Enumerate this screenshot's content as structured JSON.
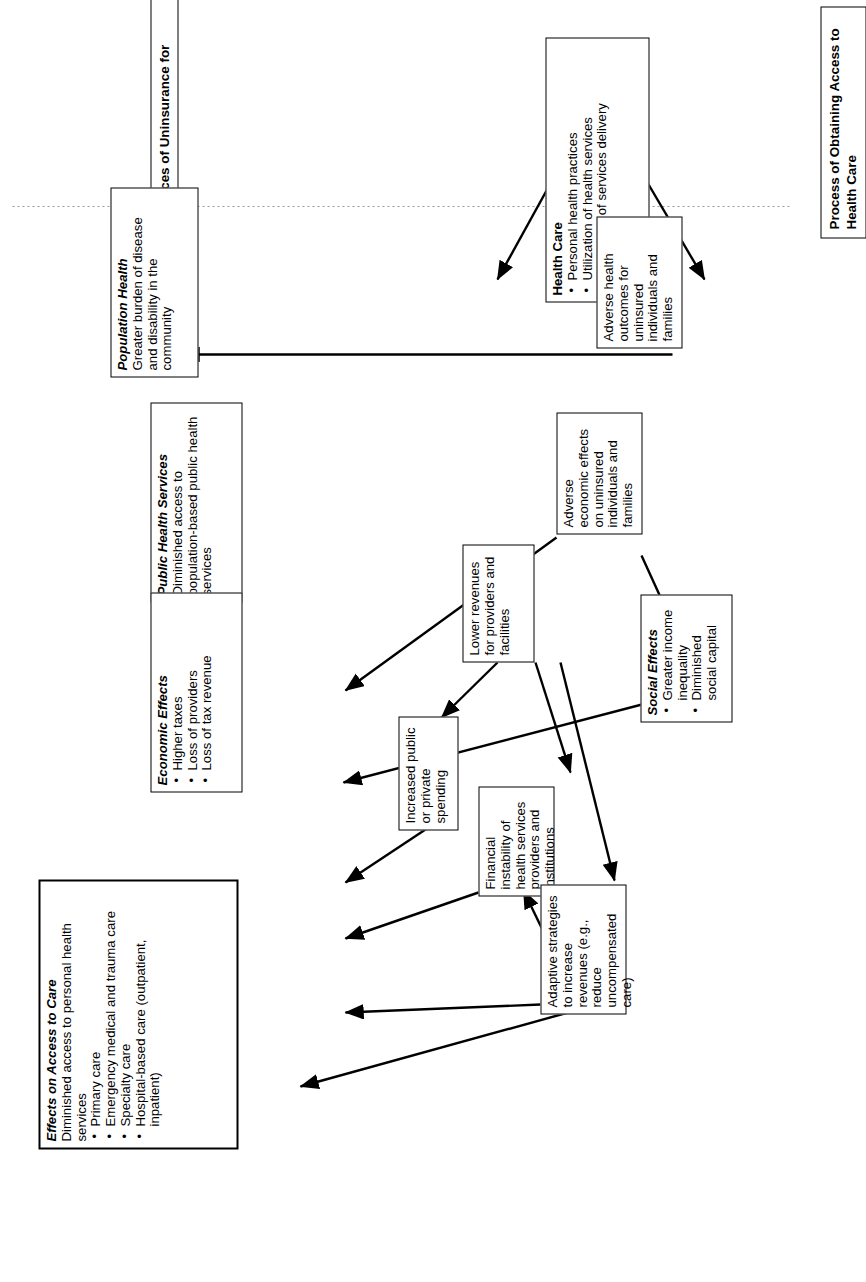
{
  "figure": {
    "headings": {
      "communities": "Selected Consequences of Uninsurance for Communities",
      "process": "Process of Obtaining Access to Health Care"
    },
    "nodes": {
      "health_care": {
        "title": "Health Care",
        "bullets": [
          "Personal health practices",
          "Utilization of health services",
          "Processes of services delivery"
        ]
      },
      "adverse_health": {
        "text": "Adverse health outcomes for uninsured individuals and families"
      },
      "adverse_economic": {
        "text": "Adverse economic effects on uninsured individuals and families"
      },
      "lower_revenues": {
        "text": "Lower revenues for providers and facilities"
      },
      "social_effects": {
        "title": "Social Effects",
        "bullets": [
          "Greater income inequality",
          "Diminished social capital"
        ]
      },
      "increased_spending": {
        "text": "Increased public or private spending"
      },
      "financial_instability": {
        "text": "Financial instability of health services providers and institutions"
      },
      "adaptive_strategies": {
        "text": "Adaptive strategies to increase revenues (e.g., reduce uncompensated care)"
      },
      "population_health": {
        "title": "Population Health",
        "subtitle": "Greater burden of disease and disability in the community"
      },
      "public_health_services": {
        "title": "Public Health Services",
        "subtitle": "Diminished access to population-based public health services"
      },
      "economic_effects": {
        "title": "Economic Effects",
        "bullets": [
          "Higher taxes",
          "Loss of providers",
          "Loss of tax revenue"
        ]
      },
      "effects_access": {
        "title": "Effects on Access to Care",
        "subtitle": "Diminished access to personal health services",
        "bullets": [
          "Primary care",
          "Emergency medical and trauma care",
          "Specialty care",
          "Hospital-based care (outpatient, inpatient)"
        ]
      }
    },
    "colors": {
      "line": "#000000",
      "divider": "#999999",
      "background": "#ffffff"
    }
  }
}
